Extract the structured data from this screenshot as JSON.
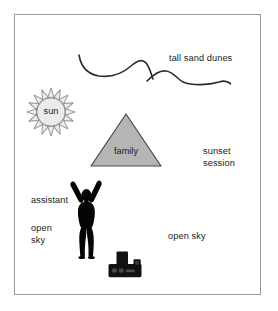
{
  "scene": {
    "frame": {
      "border_color": "#9a9a9a",
      "background": "#ffffff"
    },
    "labels": {
      "tall_sand_dunes": "tall sand dunes",
      "sunset_session": "sunset\nsession",
      "assistant": "assistant",
      "open_sky_left": "open\nsky",
      "open_sky_right": "open sky"
    },
    "sun": {
      "label": "sun",
      "fill": "#ebebeb",
      "stroke": "#8d8d8d",
      "ray_count": 16
    },
    "triangle": {
      "label": "family",
      "fill": "#b5b5b5",
      "stroke": "#4a4a4a"
    },
    "dunes": {
      "name": "tall-sand-dunes-curves",
      "stroke": "#2b2b2b",
      "segments": 2
    },
    "person": {
      "name": "assistant-figure",
      "fill": "#050505",
      "pose": "arms-raised"
    },
    "camera": {
      "name": "camera-icon",
      "fill": "#111111"
    }
  }
}
